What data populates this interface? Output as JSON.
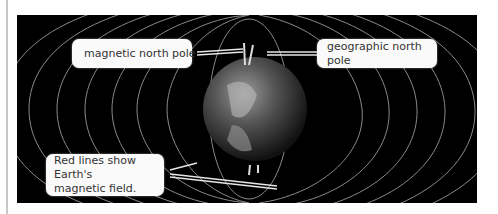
{
  "diagram": {
    "title": "Earth's magnetic field",
    "labels": {
      "magnetic_north_pole": "magnetic north pole",
      "geographic_north_pole": "geographic north pole",
      "field_note_line1": "Red lines show Earth's",
      "field_note_line2": "magnetic field."
    },
    "colors": {
      "background": "#000000",
      "field_lines": "#8a8a8a",
      "callout_bg": "#fafafa",
      "callout_text": "#333333"
    }
  }
}
